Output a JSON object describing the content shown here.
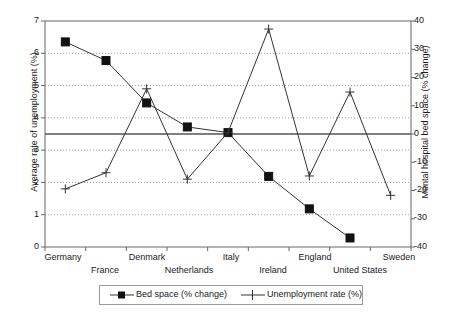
{
  "chart_data": {
    "type": "line",
    "title": "",
    "subtitle": "",
    "categories": [
      "Germany",
      "France",
      "Denmark",
      "Netherlands",
      "Italy",
      "Ireland",
      "England",
      "United States",
      "Sweden"
    ],
    "series": [
      {
        "name": "Bed space (% change)",
        "axis": "right",
        "marker": "square",
        "values": [
          32.6,
          26.0,
          11.0,
          2.5,
          0.5,
          -15.0,
          -26.5,
          -36.8,
          null
        ]
      },
      {
        "name": "Unemployment rate (%)",
        "axis": "left",
        "marker": "cross",
        "values": [
          1.8,
          2.3,
          4.9,
          2.1,
          3.55,
          6.75,
          2.2,
          4.8,
          1.6
        ]
      }
    ],
    "y_left": {
      "label": "Average rate of unemployment (%)",
      "ticks": [
        0,
        1,
        2,
        3,
        4,
        5,
        6,
        7
      ],
      "ylim": [
        0,
        7
      ]
    },
    "y_right": {
      "label": "Mental hospital bed space (% change)",
      "ticks": [
        -40,
        -30,
        -20,
        -10,
        0,
        10,
        20,
        30,
        40
      ],
      "ylim": [
        -40,
        40
      ]
    },
    "xlabel": "",
    "grid": true,
    "legend_position": "bottom",
    "colors": {
      "line": "#333333",
      "grid": "#888888",
      "axis": "#666666",
      "zero_line": "#555555",
      "marker_fill": "#111111"
    }
  },
  "axes": {
    "left_title": "Average rate of unemployment (%)",
    "right_title": "Mental hospital bed space (% change)",
    "left_ticks": [
      "7",
      "6",
      "5",
      "4",
      "3",
      "2",
      "1",
      "0"
    ],
    "right_ticks": [
      "40",
      "30",
      "20",
      "10",
      "0",
      "-10",
      "-20",
      "-30",
      "-40"
    ],
    "categories": [
      "Germany",
      "France",
      "Denmark",
      "Netherlands",
      "Italy",
      "Ireland",
      "England",
      "United States",
      "Sweden"
    ]
  },
  "legend": {
    "bed_space_label": "Bed space (% change)",
    "unemployment_label": "Unemployment rate (%)"
  }
}
